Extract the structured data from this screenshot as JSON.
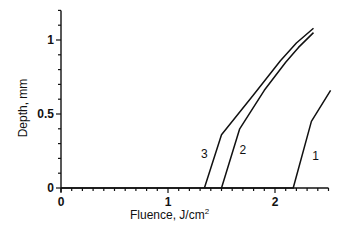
{
  "chart_data": {
    "type": "line",
    "title": "",
    "xlabel": "Fluence, J/cm",
    "xlabel_sup": "2",
    "ylabel": "Depth, mm",
    "xlim": [
      0,
      2.5
    ],
    "ylim": [
      0,
      1.2
    ],
    "x_ticks": [
      0,
      1,
      2
    ],
    "x_tick_labels": [
      "0",
      "1",
      "2"
    ],
    "x_minor_step": 0.1,
    "y_ticks": [
      0,
      0.5,
      1
    ],
    "y_tick_labels": [
      "0",
      "0.5",
      "1"
    ],
    "y_minor_step": 0.1,
    "grid": false,
    "legend": "none (curves labeled inline)",
    "series": [
      {
        "name": "1",
        "label": "1",
        "points": [
          [
            0,
            0
          ],
          [
            2.17,
            0
          ],
          [
            2.34,
            0.45
          ],
          [
            2.52,
            0.66
          ]
        ]
      },
      {
        "name": "2",
        "label": "2",
        "points": [
          [
            1.5,
            0
          ],
          [
            1.67,
            0.4
          ],
          [
            1.9,
            0.66
          ],
          [
            2.1,
            0.85
          ],
          [
            2.22,
            0.95
          ],
          [
            2.36,
            1.05
          ]
        ]
      },
      {
        "name": "3",
        "label": "3",
        "points": [
          [
            1.34,
            0
          ],
          [
            1.5,
            0.36
          ],
          [
            1.8,
            0.63
          ],
          [
            2.05,
            0.86
          ],
          [
            2.2,
            0.98
          ],
          [
            2.36,
            1.08
          ]
        ]
      }
    ],
    "annotations": [
      {
        "text": "3",
        "x": 1.34,
        "y": 0.2
      },
      {
        "text": "2",
        "x": 1.7,
        "y": 0.23
      },
      {
        "text": "1",
        "x": 2.38,
        "y": 0.19
      }
    ]
  }
}
